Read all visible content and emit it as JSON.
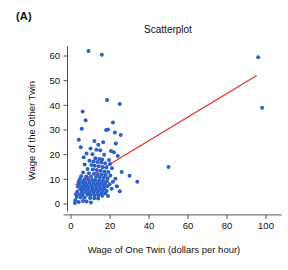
{
  "figure": {
    "panel_label": "(A)",
    "background_color": "#ffffff"
  },
  "chart_data": {
    "type": "scatter",
    "title": "Scatterplot",
    "xlabel": "Wage of One Twin (dollars per hour)",
    "ylabel": "Wage of the Other Twin",
    "xlim": [
      -2,
      108
    ],
    "ylim": [
      -3,
      64
    ],
    "xticks": [
      0,
      20,
      40,
      60,
      80,
      100
    ],
    "yticks": [
      0,
      10,
      20,
      30,
      40,
      50,
      60
    ],
    "xtick_labels": [
      "0",
      "20",
      "40",
      "60",
      "80",
      "100"
    ],
    "ytick_labels": [
      "0",
      "10",
      "20",
      "30",
      "40",
      "50",
      "60"
    ],
    "grid": false,
    "legend": "none",
    "point_color": "#2b5fc9",
    "point_size": 2.0,
    "series": [
      {
        "name": "Twin wage pairs",
        "marker": "circle",
        "color": "#2b5fc9",
        "points": [
          [
            9.0,
            62.0
          ],
          [
            15.8,
            60.5
          ],
          [
            96.0,
            59.5
          ],
          [
            18.5,
            42.2
          ],
          [
            25.0,
            40.5
          ],
          [
            98.0,
            39.0
          ],
          [
            6.0,
            37.5
          ],
          [
            7.5,
            34.0
          ],
          [
            21.5,
            33.0
          ],
          [
            5.5,
            30.5
          ],
          [
            18.0,
            30.0
          ],
          [
            19.0,
            30.2
          ],
          [
            22.5,
            29.0
          ],
          [
            25.5,
            28.0
          ],
          [
            4.0,
            26.0
          ],
          [
            12.0,
            25.5
          ],
          [
            16.5,
            25.0
          ],
          [
            23.0,
            24.5
          ],
          [
            14.0,
            24.0
          ],
          [
            5.0,
            23.0
          ],
          [
            10.0,
            22.5
          ],
          [
            13.0,
            22.0
          ],
          [
            15.0,
            21.8
          ],
          [
            20.5,
            21.5
          ],
          [
            22.0,
            21.0
          ],
          [
            8.0,
            20.5
          ],
          [
            11.0,
            20.2
          ],
          [
            17.0,
            20.0
          ],
          [
            24.0,
            19.5
          ],
          [
            6.5,
            19.0
          ],
          [
            12.5,
            18.5
          ],
          [
            14.5,
            18.2
          ],
          [
            16.0,
            18.0
          ],
          [
            19.5,
            17.8
          ],
          [
            9.5,
            17.5
          ],
          [
            11.5,
            17.2
          ],
          [
            13.5,
            17.0
          ],
          [
            15.5,
            16.8
          ],
          [
            17.5,
            16.5
          ],
          [
            20.0,
            16.2
          ],
          [
            7.0,
            16.0
          ],
          [
            10.5,
            15.8
          ],
          [
            12.2,
            15.5
          ],
          [
            14.2,
            15.3
          ],
          [
            16.2,
            15.0
          ],
          [
            18.2,
            14.8
          ],
          [
            21.0,
            14.5
          ],
          [
            50.0,
            15.0
          ],
          [
            8.5,
            14.2
          ],
          [
            11.2,
            14.0
          ],
          [
            13.2,
            13.8
          ],
          [
            15.2,
            13.5
          ],
          [
            17.2,
            13.2
          ],
          [
            19.2,
            13.0
          ],
          [
            26.0,
            13.0
          ],
          [
            6.2,
            12.8
          ],
          [
            9.2,
            12.5
          ],
          [
            11.8,
            12.3
          ],
          [
            13.8,
            12.1
          ],
          [
            15.8,
            12.0
          ],
          [
            17.8,
            11.8
          ],
          [
            20.2,
            11.6
          ],
          [
            30.0,
            11.5
          ],
          [
            5.2,
            11.3
          ],
          [
            7.8,
            11.1
          ],
          [
            10.2,
            11.0
          ],
          [
            12.8,
            10.9
          ],
          [
            14.8,
            10.8
          ],
          [
            16.8,
            10.6
          ],
          [
            18.8,
            10.4
          ],
          [
            22.8,
            10.2
          ],
          [
            4.5,
            10.0
          ],
          [
            6.8,
            9.9
          ],
          [
            8.8,
            9.8
          ],
          [
            10.8,
            9.7
          ],
          [
            12.4,
            9.6
          ],
          [
            14.4,
            9.5
          ],
          [
            16.4,
            9.4
          ],
          [
            18.4,
            9.2
          ],
          [
            21.5,
            9.0
          ],
          [
            34.0,
            9.0
          ],
          [
            3.8,
            8.9
          ],
          [
            5.8,
            8.8
          ],
          [
            7.4,
            8.7
          ],
          [
            9.4,
            8.6
          ],
          [
            11.4,
            8.5
          ],
          [
            13.4,
            8.4
          ],
          [
            15.4,
            8.3
          ],
          [
            17.4,
            8.2
          ],
          [
            19.8,
            8.0
          ],
          [
            4.2,
            7.9
          ],
          [
            6.4,
            7.8
          ],
          [
            8.2,
            7.7
          ],
          [
            10.4,
            7.6
          ],
          [
            12.6,
            7.5
          ],
          [
            14.6,
            7.4
          ],
          [
            16.6,
            7.3
          ],
          [
            18.6,
            7.2
          ],
          [
            23.5,
            7.2
          ],
          [
            3.5,
            7.0
          ],
          [
            5.4,
            6.9
          ],
          [
            7.2,
            6.8
          ],
          [
            9.0,
            6.7
          ],
          [
            11.0,
            6.6
          ],
          [
            13.0,
            6.5
          ],
          [
            15.0,
            6.4
          ],
          [
            17.0,
            6.3
          ],
          [
            20.8,
            6.2
          ],
          [
            4.8,
            6.0
          ],
          [
            6.6,
            5.9
          ],
          [
            8.6,
            5.8
          ],
          [
            10.6,
            5.7
          ],
          [
            12.3,
            5.6
          ],
          [
            14.3,
            5.5
          ],
          [
            16.3,
            5.4
          ],
          [
            18.3,
            5.3
          ],
          [
            25.0,
            5.2
          ],
          [
            3.2,
            5.0
          ],
          [
            5.6,
            4.9
          ],
          [
            7.6,
            4.8
          ],
          [
            9.6,
            4.7
          ],
          [
            11.6,
            4.6
          ],
          [
            13.6,
            4.5
          ],
          [
            15.6,
            4.4
          ],
          [
            17.6,
            4.3
          ],
          [
            2.5,
            4.0
          ],
          [
            4.6,
            3.9
          ],
          [
            6.0,
            3.8
          ],
          [
            8.4,
            3.7
          ],
          [
            10.0,
            3.6
          ],
          [
            12.0,
            3.5
          ],
          [
            14.0,
            3.4
          ],
          [
            16.0,
            3.3
          ],
          [
            19.0,
            3.2
          ],
          [
            3.0,
            2.8
          ],
          [
            5.0,
            2.6
          ],
          [
            7.0,
            2.5
          ],
          [
            9.8,
            2.4
          ],
          [
            11.9,
            2.3
          ],
          [
            13.9,
            2.2
          ],
          [
            2.2,
            1.5
          ],
          [
            6.2,
            1.2
          ],
          [
            8.0,
            1.0
          ],
          [
            4.0,
            0.8
          ],
          [
            10.2,
            0.6
          ],
          [
            2.0,
            0.4
          ]
        ]
      }
    ],
    "regression_line": {
      "name": "Least-squares regression line",
      "color": "#e8312a",
      "x_start": 2.5,
      "y_start": 7.8,
      "x_end": 95.0,
      "y_end": 52.0
    }
  }
}
